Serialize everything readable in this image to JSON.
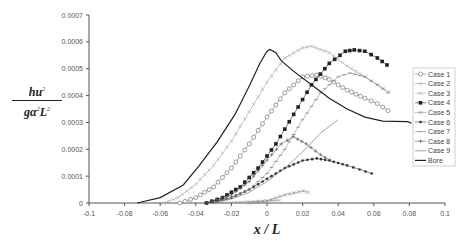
{
  "chart_data": {
    "type": "line",
    "title": "",
    "xlabel": "x / L",
    "ylabel": "hu^2 / (g α^2 L^2)",
    "ylabel_parts": {
      "numerator": "hu",
      "num_sup": "2",
      "den_a": "gα",
      "den_sup1": "2",
      "den_b": "L",
      "den_sup2": "2"
    },
    "xlim": [
      -0.1,
      0.1
    ],
    "ylim": [
      0,
      0.0007
    ],
    "x_ticks": [
      "-0.1",
      "-0.08",
      "-0.06",
      "-0.04",
      "-0.02",
      "0",
      "0.02",
      "0.04",
      "0.06",
      "0.08",
      "0.1"
    ],
    "y_ticks": [
      "0",
      "0.0001",
      "0.0002",
      "0.0003",
      "0.0004",
      "0.0005",
      "0.0006",
      "0.0007"
    ],
    "grid": false,
    "legend_position": "right",
    "series": [
      {
        "name": "Case 1",
        "marker": "open-circle",
        "color": "#777777",
        "points": [
          [
            -0.049,
            0
          ],
          [
            -0.04,
            2e-05
          ],
          [
            -0.03,
            6e-05
          ],
          [
            -0.02,
            0.00013
          ],
          [
            -0.01,
            0.00022
          ],
          [
            0,
            0.00032
          ],
          [
            0.01,
            0.00041
          ],
          [
            0.02,
            0.00047
          ],
          [
            0.028,
            0.000477
          ],
          [
            0.035,
            0.00046
          ],
          [
            0.045,
            0.00042
          ],
          [
            0.055,
            0.00039
          ],
          [
            0.062,
            0.00037
          ],
          [
            0.068,
            0.000344
          ]
        ]
      },
      {
        "name": "Case 2",
        "marker": "small-x",
        "color": "#999999",
        "points": [
          [
            -0.03,
            0
          ],
          [
            -0.02,
            2e-06
          ],
          [
            -0.01,
            5e-06
          ],
          [
            0,
            8e-06
          ],
          [
            0.007,
            1e-05
          ]
        ]
      },
      {
        "name": "Case 3",
        "marker": "x",
        "color": "#aaaaaa",
        "points": [
          [
            -0.058,
            0
          ],
          [
            -0.05,
            2e-05
          ],
          [
            -0.04,
            7e-05
          ],
          [
            -0.03,
            0.00014
          ],
          [
            -0.02,
            0.00023
          ],
          [
            -0.01,
            0.00034
          ],
          [
            0,
            0.00045
          ],
          [
            0.01,
            0.00054
          ],
          [
            0.02,
            0.000578
          ],
          [
            0.025,
            0.000584
          ],
          [
            0.035,
            0.00056
          ],
          [
            0.045,
            0.00051
          ],
          [
            0.055,
            0.00047
          ],
          [
            0.062,
            0.00044
          ],
          [
            0.0686,
            0.000414
          ]
        ]
      },
      {
        "name": "Case 4",
        "marker": "filled-square",
        "color": "#222222",
        "points": [
          [
            -0.034,
            0
          ],
          [
            -0.025,
            2e-05
          ],
          [
            -0.015,
            6e-05
          ],
          [
            -0.005,
            0.00013
          ],
          [
            0.005,
            0.00022
          ],
          [
            0.015,
            0.00033
          ],
          [
            0.025,
            0.00044
          ],
          [
            0.035,
            0.00052
          ],
          [
            0.044,
            0.000565
          ],
          [
            0.049,
            0.00057
          ],
          [
            0.055,
            0.000565
          ],
          [
            0.062,
            0.00054
          ],
          [
            0.0674,
            0.000514
          ]
        ]
      },
      {
        "name": "Case 5",
        "marker": "x",
        "color": "#888888",
        "points": [
          [
            -0.01,
            0
          ],
          [
            0,
            8e-06
          ],
          [
            0.01,
            3e-05
          ],
          [
            0.0204,
            4.47e-05
          ],
          [
            0.023,
            4e-05
          ]
        ]
      },
      {
        "name": "Case 6",
        "marker": "filled-dot",
        "color": "#333333",
        "points": [
          [
            -0.034,
            0
          ],
          [
            -0.02,
            2e-05
          ],
          [
            -0.01,
            5e-05
          ],
          [
            0,
            9e-05
          ],
          [
            0.01,
            0.00013
          ],
          [
            0.02,
            0.000158
          ],
          [
            0.028,
            0.000166
          ],
          [
            0.035,
            0.000158
          ],
          [
            0.045,
            0.00014
          ],
          [
            0.052,
            0.000125
          ],
          [
            0.0588,
            0.00011
          ]
        ]
      },
      {
        "name": "Case 7",
        "marker": "dash",
        "color": "#888888",
        "points": [
          [
            -0.03,
            0
          ],
          [
            -0.02,
            2e-05
          ],
          [
            -0.01,
            5e-05
          ],
          [
            0,
            0.00011
          ],
          [
            0.01,
            0.0002
          ],
          [
            0.02,
            0.00031
          ],
          [
            0.03,
            0.00041
          ],
          [
            0.04,
            0.00047
          ],
          [
            0.0466,
            0.000484
          ],
          [
            0.055,
            0.00047
          ],
          [
            0.062,
            0.00044
          ],
          [
            0.068,
            0.00041
          ]
        ]
      },
      {
        "name": "Case 8",
        "marker": "plus",
        "color": "#555555",
        "points": [
          [
            -0.034,
            0
          ],
          [
            -0.02,
            3e-05
          ],
          [
            -0.01,
            8e-05
          ],
          [
            0,
            0.00016
          ],
          [
            0.008,
            0.00022
          ],
          [
            0.0148,
            0.000247
          ],
          [
            0.022,
            0.00022
          ],
          [
            0.03,
            0.00018
          ],
          [
            0.0354,
            0.00016
          ]
        ]
      },
      {
        "name": "Case 9",
        "marker": "line",
        "color": "#666666",
        "points": [
          [
            -0.03,
            0
          ],
          [
            -0.02,
            1.5e-05
          ],
          [
            -0.01,
            4e-05
          ],
          [
            0,
            8e-05
          ],
          [
            0.01,
            0.00013
          ],
          [
            0.02,
            0.00019
          ],
          [
            0.03,
            0.00026
          ],
          [
            0.04,
            0.00031
          ]
        ]
      },
      {
        "name": "Bore",
        "marker": "none",
        "color": "#222222",
        "points": [
          [
            -0.073,
            0
          ],
          [
            -0.06,
            2e-05
          ],
          [
            -0.047,
            6.7e-05
          ],
          [
            -0.038,
            0.00014
          ],
          [
            -0.028,
            0.000228
          ],
          [
            -0.018,
            0.00033
          ],
          [
            -0.0096,
            0.00044
          ],
          [
            -0.004,
            0.00052
          ],
          [
            0,
            0.000565
          ],
          [
            0.0017,
            0.000572
          ],
          [
            0.005,
            0.00056
          ],
          [
            0.008,
            0.00053
          ],
          [
            0.015,
            0.00049
          ],
          [
            0.025,
            0.00044
          ],
          [
            0.035,
            0.00039
          ],
          [
            0.045,
            0.00035
          ],
          [
            0.055,
            0.00032
          ],
          [
            0.065,
            0.000305
          ],
          [
            0.079,
            0.000303
          ],
          [
            0.0812,
            0.000297
          ]
        ]
      }
    ]
  }
}
